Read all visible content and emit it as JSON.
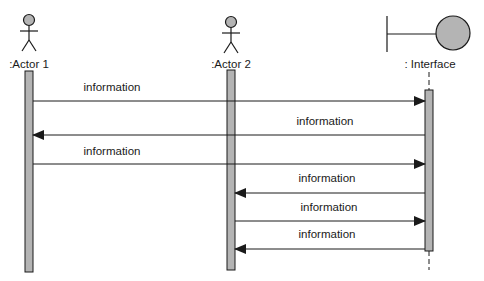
{
  "diagram": {
    "type": "uml-sequence",
    "colors": {
      "line": "#1a1a1a",
      "fill": "#b4b4b4",
      "background": "#ffffff"
    },
    "participants": [
      {
        "id": "actor1",
        "kind": "actor",
        "label": ":Actor 1"
      },
      {
        "id": "actor2",
        "kind": "actor",
        "label": ":Actor 2"
      },
      {
        "id": "interface",
        "kind": "boundary",
        "label": ": Interface"
      }
    ],
    "messages": [
      {
        "from": "actor1",
        "to": "interface",
        "label": "information"
      },
      {
        "from": "interface",
        "to": "actor1",
        "label": "information"
      },
      {
        "from": "actor1",
        "to": "interface",
        "label": "information"
      },
      {
        "from": "interface",
        "to": "actor2",
        "label": "information"
      },
      {
        "from": "actor2",
        "to": "interface",
        "label": "information"
      },
      {
        "from": "interface",
        "to": "actor2",
        "label": "information"
      }
    ]
  }
}
